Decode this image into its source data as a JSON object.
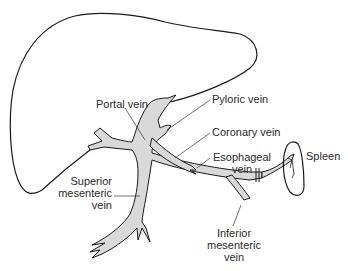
{
  "diagram": {
    "type": "anatomical illustration",
    "colors": {
      "vein_fill": "#d9d9d9",
      "outline": "#1a1a1a",
      "label_text": "#2a2a2a"
    },
    "labels": {
      "portal_vein": "Portal vein",
      "pyloric_vein": "Pyloric vein",
      "coronary_vein": "Coronary vein",
      "esophageal_vein_line1": "Esophageal",
      "esophageal_vein_line2": "vein",
      "spleen": "Spleen",
      "superior_mesenteric_line1": "Superior",
      "superior_mesenteric_line2": "mesenteric",
      "superior_mesenteric_line3": "vein",
      "inferior_mesenteric_line1": "Inferior",
      "inferior_mesenteric_line2": "mesenteric",
      "inferior_mesenteric_line3": "vein"
    },
    "structures": [
      "liver",
      "portal vein",
      "pyloric vein",
      "coronary vein",
      "esophageal vein",
      "splenic vein",
      "spleen",
      "superior mesenteric vein",
      "inferior mesenteric vein"
    ]
  }
}
